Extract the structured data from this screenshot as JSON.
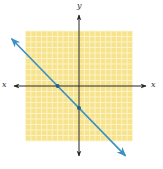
{
  "chart_data": {
    "type": "line",
    "title": "",
    "xlabel": "x",
    "ylabel": "y",
    "xlim": [
      -10,
      10
    ],
    "ylim": [
      -10,
      10
    ],
    "grid": true,
    "grid_step": 1,
    "series": [
      {
        "name": "y = -x - 4",
        "equation": "y = -x - 4",
        "slope": -1,
        "intercept": -4,
        "x": [
          -12.6,
          8.7
        ],
        "y": [
          8.6,
          -12.7
        ],
        "arrows_both_ends": true
      }
    ],
    "points": [
      {
        "label": "x-intercept",
        "x": -4,
        "y": 0
      },
      {
        "label": "y-intercept",
        "x": 0,
        "y": -4
      }
    ]
  },
  "axes": {
    "x_label_left": "x",
    "x_label_right": "x",
    "y_label_top": "y"
  },
  "colors": {
    "grid_fill": "#f7e38c",
    "grid_line": "#fdf6d6",
    "axis": "#222222",
    "line": "#3a8fc4",
    "point": "#1f5f8a"
  }
}
